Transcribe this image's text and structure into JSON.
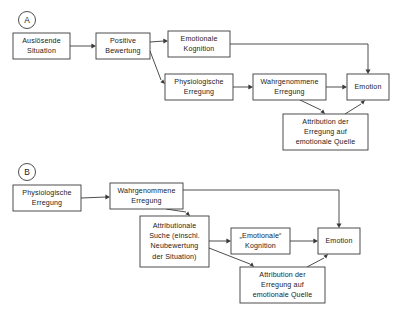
{
  "figure": {
    "background_color": "#ffffff",
    "line_color": "#3a3a3a",
    "text_color": "#1b1b1b"
  },
  "panels": [
    {
      "id": "panel-a",
      "label": "A",
      "circle": {
        "cx": 27,
        "cy": 20,
        "r": 8.5
      },
      "boxes": [
        {
          "id": "a-ausloesende-situation",
          "name": "box-ausloesende-situation",
          "x": 13,
          "y": 33,
          "w": 57,
          "h": 26,
          "lines": [
            "Auslösende",
            "Situation"
          ]
        },
        {
          "id": "a-positive-bewertung",
          "name": "box-positive-bewertung",
          "x": 96,
          "y": 33,
          "w": 54,
          "h": 26,
          "lines": [
            "Positive",
            "Bewertung"
          ]
        },
        {
          "id": "a-emotionale-kognition",
          "name": "box-emotionale-kognition",
          "x": 168,
          "y": 31,
          "w": 62,
          "h": 26,
          "lines": [
            "Emotionale",
            "Kognition"
          ]
        },
        {
          "id": "a-physiologische-erregung",
          "name": "box-physiologische-erregung",
          "x": 165,
          "y": 74,
          "w": 68,
          "h": 26,
          "lines": [
            "Physiologische",
            "Erregung"
          ]
        },
        {
          "id": "a-wahrgenommene-erregung",
          "name": "box-wahrgenommene-erregung",
          "x": 253,
          "y": 74,
          "w": 73,
          "h": 26,
          "lines": [
            "Wahrgenommene",
            "Erregung"
          ]
        },
        {
          "id": "a-emotion",
          "name": "box-emotion",
          "x": 347,
          "y": 74,
          "w": 42,
          "h": 26,
          "lines": [
            "Emotion"
          ]
        },
        {
          "id": "a-attribution",
          "name": "box-attribution-erregung-emotionale-quelle",
          "x": 283,
          "y": 114,
          "w": 85,
          "h": 36,
          "lines": [
            "Attribution der",
            "Erregung auf",
            "emotionale Quelle"
          ]
        }
      ],
      "connections": [
        {
          "id": "a-c1",
          "name": "arrow-situation-to-bewertung",
          "from": "a-ausloesende-situation",
          "to": "a-positive-bewertung",
          "points": "70,46 93,46",
          "arrow": {
            "x": 96,
            "y": 46,
            "dir": "right"
          }
        },
        {
          "id": "a-c2",
          "name": "arrow-bewertung-to-kognition",
          "from": "a-positive-bewertung",
          "to": "a-emotionale-kognition",
          "points": "150,42 164,41",
          "arrow": {
            "x": 168,
            "y": 41,
            "dir": "right"
          }
        },
        {
          "id": "a-c3",
          "name": "arrow-bewertung-to-physiologische",
          "from": "a-positive-bewertung",
          "to": "a-physiologische-erregung",
          "points": "150,51 161,80",
          "arrow": {
            "x": 165,
            "y": 84,
            "dir": "downright"
          }
        },
        {
          "id": "a-c4",
          "name": "arrow-kognition-to-emotion",
          "from": "a-emotionale-kognition",
          "to": "a-emotion",
          "points": "230,44 368,44 368,70",
          "arrow": {
            "x": 368,
            "y": 74,
            "dir": "down"
          }
        },
        {
          "id": "a-c5",
          "name": "arrow-physiologische-to-wahrgenommene",
          "from": "a-physiologische-erregung",
          "to": "a-wahrgenommene-erregung",
          "points": "233,87 249,87",
          "arrow": {
            "x": 253,
            "y": 87,
            "dir": "right"
          }
        },
        {
          "id": "a-c6",
          "name": "arrow-wahrgenommene-to-emotion",
          "from": "a-wahrgenommene-erregung",
          "to": "a-emotion",
          "points": "326,87 343,87",
          "arrow": {
            "x": 347,
            "y": 87,
            "dir": "right"
          }
        },
        {
          "id": "a-c7",
          "name": "arrow-wahrgenommene-to-attribution",
          "from": "a-wahrgenommene-erregung",
          "to": "a-attribution",
          "points": "300,100 321,110",
          "arrow": {
            "x": 325,
            "y": 114,
            "dir": "downright"
          }
        },
        {
          "id": "a-c8",
          "name": "arrow-attribution-to-emotion",
          "from": "a-attribution",
          "to": "a-emotion",
          "points": "345,114 361,104",
          "arrow": {
            "x": 365,
            "y": 100,
            "dir": "upright"
          }
        }
      ]
    },
    {
      "id": "panel-b",
      "label": "B",
      "circle": {
        "cx": 27,
        "cy": 172,
        "r": 8.5
      },
      "boxes": [
        {
          "id": "b-physiologische-erregung",
          "name": "box-physiologische-erregung",
          "x": 13,
          "y": 185,
          "w": 68,
          "h": 26,
          "lines": [
            "Physiologische",
            "Erregung"
          ]
        },
        {
          "id": "b-wahrgenommene-erregung",
          "name": "box-wahrgenommene-erregung",
          "x": 110,
          "y": 183,
          "w": 73,
          "h": 26,
          "lines": [
            "Wahrgenommene",
            "Erregung"
          ]
        },
        {
          "id": "b-attributionale-suche",
          "name": "box-attributionale-suche",
          "x": 140,
          "y": 216,
          "w": 69,
          "h": 51,
          "lines": [
            "Attributionale",
            "Suche (einschl.",
            "Neubewertung",
            "der Situation)"
          ]
        },
        {
          "id": "b-emotionale-kognition",
          "name": "box-emotionale-kognition",
          "x": 231,
          "y": 228,
          "w": 59,
          "h": 26,
          "lines": [
            "„Emotionale“",
            "Kognition"
          ]
        },
        {
          "id": "b-attribution",
          "name": "box-attribution-erregung-emotionale-quelle",
          "x": 240,
          "y": 267,
          "w": 85,
          "h": 36,
          "lines": [
            "Attribution der",
            "Erregung auf",
            "emotionale Quelle"
          ]
        },
        {
          "id": "b-emotion",
          "name": "box-emotion",
          "x": 318,
          "y": 228,
          "w": 42,
          "h": 26,
          "lines": [
            "Emotion"
          ]
        }
      ],
      "connections": [
        {
          "id": "b-c1",
          "name": "arrow-physiologische-to-wahrgenommene",
          "from": "b-physiologische-erregung",
          "to": "b-wahrgenommene-erregung",
          "points": "81,198 106,197",
          "arrow": {
            "x": 110,
            "y": 197,
            "dir": "right"
          }
        },
        {
          "id": "b-c2",
          "name": "arrow-wahrgenommene-to-emotion",
          "from": "b-wahrgenommene-erregung",
          "to": "b-emotion",
          "points": "183,190 339,190 339,224",
          "arrow": {
            "x": 339,
            "y": 228,
            "dir": "down"
          }
        },
        {
          "id": "b-c3",
          "name": "arrow-wahrgenommene-to-suche",
          "from": "b-wahrgenommene-erregung",
          "to": "b-attributionale-suche",
          "points": "166,209 186,212",
          "arrow": {
            "x": 190,
            "y": 216,
            "dir": "downright"
          }
        },
        {
          "id": "b-c4",
          "name": "arrow-suche-to-kognition",
          "from": "b-attributionale-suche",
          "to": "b-emotionale-kognition",
          "points": "209,241 227,241",
          "arrow": {
            "x": 231,
            "y": 241,
            "dir": "right"
          }
        },
        {
          "id": "b-c5",
          "name": "arrow-suche-to-attribution",
          "from": "b-attributionale-suche",
          "to": "b-attribution",
          "points": "209,248 250,264",
          "arrow": {
            "x": 254,
            "y": 267,
            "dir": "downright"
          }
        },
        {
          "id": "b-c6",
          "name": "arrow-kognition-to-emotion",
          "from": "b-emotionale-kognition",
          "to": "b-emotion",
          "points": "290,241 314,241",
          "arrow": {
            "x": 318,
            "y": 241,
            "dir": "right"
          }
        },
        {
          "id": "b-c7",
          "name": "arrow-attribution-to-emotion",
          "from": "b-attribution",
          "to": "b-emotion",
          "points": "307,267 324,258",
          "arrow": {
            "x": 328,
            "y": 254,
            "dir": "upright"
          }
        }
      ]
    }
  ]
}
